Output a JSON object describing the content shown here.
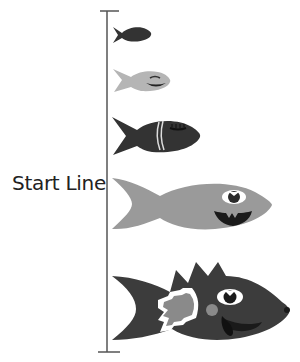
{
  "diagram": {
    "start_label": "Start Line",
    "colors": {
      "line": "#555555",
      "fish_dark": "#333333",
      "fish_light": "#b5b5b5",
      "fish_mid": "#9a9a9a",
      "fish_big": "#3c3c3c",
      "accent_gray": "#8a8a8a",
      "white": "#ffffff"
    },
    "fish": [
      {
        "id": 1,
        "size": "tiny",
        "shade": "dark",
        "face": "none"
      },
      {
        "id": 2,
        "size": "small",
        "shade": "light-gray",
        "face": "sleepy-smile"
      },
      {
        "id": 3,
        "size": "medium",
        "shade": "dark",
        "face": "sleepy-stripes"
      },
      {
        "id": 4,
        "size": "large",
        "shade": "gray",
        "face": "eye-teeth"
      },
      {
        "id": 5,
        "size": "largest",
        "shade": "dark",
        "face": "spiky-eye-tongue"
      }
    ]
  }
}
